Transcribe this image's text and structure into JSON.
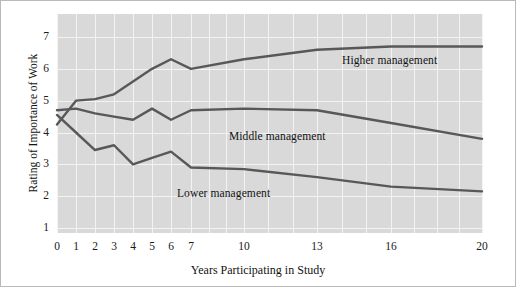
{
  "chart_data": {
    "type": "line",
    "title": "",
    "xlabel": "Years Participating in Study",
    "ylabel": "Rating of Importance of Work",
    "xtick_labels": [
      "0",
      "1",
      "2",
      "3",
      "4",
      "5",
      "6",
      "7",
      "10",
      "13",
      "16",
      "20"
    ],
    "xtick_values": [
      0,
      1,
      2,
      3,
      4,
      5,
      6,
      7,
      10,
      13,
      16,
      20
    ],
    "ytick_labels": [
      "1",
      "2",
      "3",
      "4",
      "5",
      "6",
      "7"
    ],
    "ytick_values": [
      1,
      2,
      3,
      4,
      5,
      6,
      7
    ],
    "ylim": [
      1,
      7
    ],
    "xlim": [
      0,
      20
    ],
    "grid": true,
    "legend_position": "inline-annotations",
    "x": [
      0,
      1,
      2,
      3,
      4,
      5,
      6,
      7,
      10,
      13,
      16,
      20
    ],
    "series": [
      {
        "name": "Higher management",
        "label": "Higher management",
        "color": "#585858",
        "values": [
          4.25,
          5.0,
          5.05,
          5.2,
          5.6,
          6.0,
          6.3,
          6.0,
          6.3,
          6.6,
          6.7,
          6.7
        ]
      },
      {
        "name": "Middle management",
        "label": "Middle management",
        "color": "#585858",
        "values": [
          4.7,
          4.75,
          4.6,
          4.5,
          4.4,
          4.75,
          4.4,
          4.7,
          4.75,
          4.7,
          4.3,
          3.8
        ]
      },
      {
        "name": "Lower management",
        "label": "Lower management",
        "color": "#585858",
        "values": [
          4.55,
          4.0,
          3.45,
          3.6,
          3.0,
          3.2,
          3.4,
          2.9,
          2.85,
          2.6,
          2.3,
          2.15
        ]
      }
    ],
    "annotations": [
      {
        "text": "Higher management",
        "x_px": 341,
        "y_px": 53
      },
      {
        "text": "Middle management",
        "x_px": 228,
        "y_px": 129
      },
      {
        "text": "Lower management",
        "x_px": 176,
        "y_px": 186
      }
    ],
    "colors": {
      "plot_background": "#d9d9d9",
      "gridline": "#f3f3f3",
      "line": "#585858",
      "text": "#121212",
      "figure_border": "#b9b9b9"
    }
  }
}
